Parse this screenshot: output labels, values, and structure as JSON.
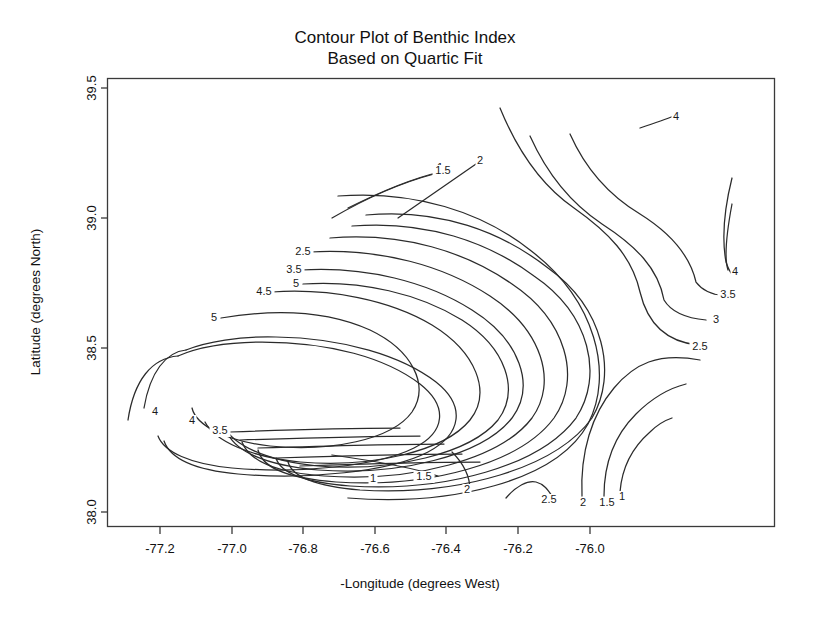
{
  "chart_data": {
    "type": "line",
    "subtype": "contour",
    "title": "Contour Plot of Benthic Index",
    "subtitle": "Based on Quartic Fit",
    "xlabel": "-Longitude (degrees West)",
    "ylabel": "Latitude (degrees North)",
    "xlim": [
      -77.32,
      -75.88
    ],
    "ylim": [
      37.92,
      39.62
    ],
    "xticks": [
      -77.2,
      -77.0,
      -76.8,
      -76.6,
      -76.4,
      -76.2,
      -76.0
    ],
    "xticklabels": [
      "-77.2",
      "-77.0",
      "-76.8",
      "-76.6",
      "-76.4",
      "-76.2",
      "-76.0"
    ],
    "yticks": [
      38.0,
      38.5,
      39.0,
      39.5
    ],
    "yticklabels": [
      "38.0",
      "38.5",
      "39.0",
      "39.5"
    ],
    "grid": false,
    "legend": "none",
    "contour_levels": [
      1,
      1.5,
      2,
      2.5,
      3,
      3.5,
      4,
      4.5,
      5
    ],
    "contour_labels": [
      {
        "text": "1",
        "x": 373,
        "y": 479
      },
      {
        "text": "1.5",
        "x": 424,
        "y": 477
      },
      {
        "text": "2",
        "x": 467,
        "y": 490
      },
      {
        "text": "1",
        "x": 440,
        "y": 168
      },
      {
        "text": "1.5",
        "x": 443,
        "y": 171
      },
      {
        "text": "2",
        "x": 480,
        "y": 161
      },
      {
        "text": "2.5",
        "x": 303,
        "y": 252
      },
      {
        "text": "3.5",
        "x": 294,
        "y": 270
      },
      {
        "text": "5",
        "x": 296,
        "y": 284
      },
      {
        "text": "4.5",
        "x": 264,
        "y": 292
      },
      {
        "text": "5",
        "x": 214,
        "y": 318
      },
      {
        "text": "4",
        "x": 155,
        "y": 412
      },
      {
        "text": "4",
        "x": 192,
        "y": 421
      },
      {
        "text": "3.5",
        "x": 220,
        "y": 431
      },
      {
        "text": "4",
        "x": 676,
        "y": 117
      },
      {
        "text": "4",
        "x": 735,
        "y": 272
      },
      {
        "text": "3.5",
        "x": 728,
        "y": 295
      },
      {
        "text": "3",
        "x": 716,
        "y": 320
      },
      {
        "text": "2.5",
        "x": 700,
        "y": 347
      },
      {
        "text": "2.5",
        "x": 549,
        "y": 500
      },
      {
        "text": "2",
        "x": 583,
        "y": 503
      },
      {
        "text": "1.5",
        "x": 607,
        "y": 503
      },
      {
        "text": "1",
        "x": 622,
        "y": 497
      }
    ]
  },
  "axes": {
    "x_title": "-Longitude (degrees West)",
    "y_title": "Latitude (degrees North)"
  }
}
